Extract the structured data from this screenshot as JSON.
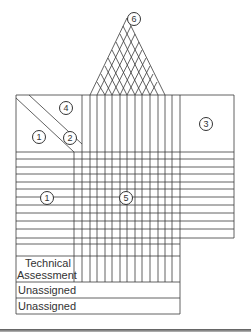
{
  "diagram": {
    "type": "house-of-quality",
    "room_labels": {
      "left_top": "1",
      "diagonal": "2",
      "right": "3",
      "top_left": "4",
      "center": "5",
      "roof": "6",
      "left_bottom": "1"
    },
    "rows": {
      "technical_assessment": "Technical\nAssessment",
      "technical_assessment_line1": "Technical",
      "technical_assessment_line2": "Assessment",
      "unassigned_1": "Unassigned",
      "unassigned_2": "Unassigned"
    },
    "colors": {
      "line": "#3a3a3a",
      "background": "#ffffff"
    }
  }
}
